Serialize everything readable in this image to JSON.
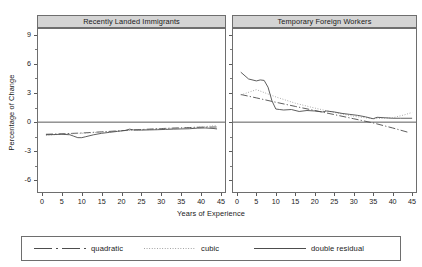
{
  "figure": {
    "axis_title_y": "Percentage of Change",
    "axis_title_x": "Years of Experience",
    "panels": [
      {
        "title": "Recently Landed Immigrants"
      },
      {
        "title": "Temporary Foreign Workers"
      }
    ],
    "legend": [
      {
        "label": "quadratic",
        "style": "dash-dot",
        "color": "#4d4d4d"
      },
      {
        "label": "cubic",
        "style": "dotted",
        "color": "#9a9a9a"
      },
      {
        "label": "double residual",
        "style": "solid",
        "color": "#4d4d4d"
      }
    ]
  },
  "chart_data": {
    "type": "line",
    "title": "",
    "xlabel": "Years of Experience",
    "ylabel": "Percentage of Change",
    "xlim": [
      -1,
      46
    ],
    "ylim": [
      -7.2,
      9.6
    ],
    "xticks": [
      0,
      5,
      10,
      15,
      20,
      25,
      30,
      35,
      40,
      45
    ],
    "yticks": [
      9,
      6,
      3,
      0,
      -3,
      -6
    ],
    "yticks_minor": [
      7.5,
      4.5,
      1.5,
      -1.5,
      -4.5
    ],
    "grid": false,
    "zero_line": true,
    "legend_position": "bottom",
    "panels": [
      {
        "name": "Recently Landed Immigrants",
        "series": [
          {
            "name": "quadratic",
            "style": "dash-dot",
            "color": "#4d4d4d",
            "x": [
              1,
              5,
              10,
              15,
              20,
              25,
              30,
              35,
              40,
              44
            ],
            "values": [
              -1.25,
              -1.2,
              -1.12,
              -1.0,
              -0.88,
              -0.76,
              -0.66,
              -0.58,
              -0.52,
              -0.5
            ]
          },
          {
            "name": "cubic",
            "style": "dotted",
            "color": "#9a9a9a",
            "x": [
              1,
              5,
              10,
              15,
              20,
              25,
              30,
              35,
              40,
              44
            ],
            "values": [
              -1.35,
              -1.25,
              -1.15,
              -1.02,
              -0.9,
              -0.78,
              -0.68,
              -0.6,
              -0.5,
              -0.35
            ]
          },
          {
            "name": "double residual",
            "style": "solid",
            "color": "#4d4d4d",
            "x": [
              1,
              3,
              5,
              7,
              8,
              9,
              10,
              11,
              13,
              15,
              17,
              19,
              21,
              22,
              23,
              25,
              27,
              29,
              31,
              33,
              35,
              37,
              39,
              41,
              43,
              44
            ],
            "values": [
              -1.3,
              -1.28,
              -1.25,
              -1.3,
              -1.45,
              -1.6,
              -1.6,
              -1.5,
              -1.3,
              -1.15,
              -1.05,
              -0.95,
              -0.85,
              -0.72,
              -0.8,
              -0.82,
              -0.8,
              -0.78,
              -0.75,
              -0.72,
              -0.7,
              -0.68,
              -0.62,
              -0.6,
              -0.65,
              -0.7
            ]
          }
        ]
      },
      {
        "name": "Temporary Foreign Workers",
        "series": [
          {
            "name": "quadratic",
            "style": "dash-dot",
            "color": "#4d4d4d",
            "x": [
              1,
              5,
              10,
              15,
              20,
              25,
              30,
              35,
              40,
              44
            ],
            "values": [
              2.85,
              2.5,
              2.05,
              1.62,
              1.2,
              0.78,
              0.35,
              -0.08,
              -0.6,
              -1.05
            ]
          },
          {
            "name": "cubic",
            "style": "dotted",
            "color": "#9a9a9a",
            "x": [
              1,
              5,
              10,
              15,
              20,
              25,
              30,
              35,
              40,
              43,
              45
            ],
            "values": [
              2.8,
              3.35,
              2.6,
              1.95,
              1.45,
              1.0,
              0.6,
              0.35,
              0.45,
              0.75,
              1.0
            ]
          },
          {
            "name": "double residual",
            "style": "solid",
            "color": "#4d4d4d",
            "x": [
              1,
              3,
              5,
              6,
              7,
              8,
              9,
              10,
              11,
              12,
              14,
              16,
              18,
              20,
              22,
              23,
              25,
              27,
              29,
              31,
              33,
              35,
              36,
              38,
              40,
              42,
              45
            ],
            "values": [
              5.15,
              4.45,
              4.25,
              4.35,
              4.3,
              3.6,
              2.2,
              1.35,
              1.3,
              1.25,
              1.3,
              1.1,
              1.2,
              1.15,
              1.05,
              1.15,
              1.05,
              0.9,
              0.8,
              0.7,
              0.55,
              0.35,
              0.5,
              0.45,
              0.4,
              0.4,
              0.4
            ]
          }
        ]
      }
    ]
  }
}
